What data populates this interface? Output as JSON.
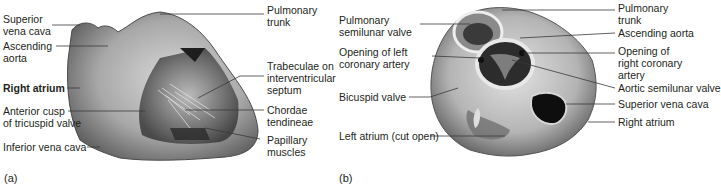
{
  "figure": {
    "panels": [
      {
        "id": "a",
        "tag": "(a)",
        "labels_left": [
          {
            "line1": "Superior",
            "line2": "vena cava"
          },
          {
            "line1": "Ascending",
            "line2": "aorta"
          },
          {
            "line1": "Right atrium",
            "line2": "",
            "bold": true
          },
          {
            "line1": "Anterior cusp",
            "line2": "of tricuspid valve"
          },
          {
            "line1": "Inferior vena cava",
            "line2": ""
          }
        ],
        "labels_right": [
          {
            "line1": "Pulmonary",
            "line2": "trunk",
            "line3": ""
          },
          {
            "line1": "Trabeculae on",
            "line2": "interventricular",
            "line3": "septum"
          },
          {
            "line1": "Chordae",
            "line2": "tendineae",
            "line3": ""
          },
          {
            "line1": "Papillary",
            "line2": "muscles",
            "line3": ""
          }
        ]
      },
      {
        "id": "b",
        "tag": "(b)",
        "labels_left": [
          {
            "line1": "Pulmonary",
            "line2": "semilunar valve"
          },
          {
            "line1": "Opening of left",
            "line2": "coronary artery"
          },
          {
            "line1": "Bicuspid valve",
            "line2": ""
          },
          {
            "line1": "Left atrium (cut open)",
            "line2": ""
          }
        ],
        "labels_right": [
          {
            "line1": "Pulmonary",
            "line2": "trunk",
            "line3": ""
          },
          {
            "line1": "Ascending aorta",
            "line2": "",
            "line3": ""
          },
          {
            "line1": "Opening of",
            "line2": "right coronary",
            "line3": "artery"
          },
          {
            "line1": "Aortic semilunar valve",
            "line2": "",
            "line3": ""
          },
          {
            "line1": "Superior vena cava",
            "line2": "",
            "line3": ""
          },
          {
            "line1": "Right atrium",
            "line2": "",
            "line3": ""
          }
        ]
      }
    ],
    "colors": {
      "text": "#231f20",
      "leader_line": "#3a3a3a",
      "tissue_light": "#cfcfcf",
      "tissue_mid": "#9a9a9a",
      "tissue_dark": "#2a2a2a"
    }
  }
}
